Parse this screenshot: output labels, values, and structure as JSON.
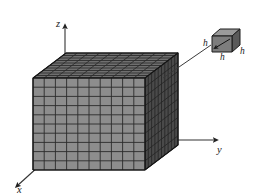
{
  "figure": {
    "title_fragment": "",
    "axes": [
      {
        "name": "z-axis",
        "label": "z",
        "x": 56,
        "y": 25,
        "direction": "up"
      },
      {
        "name": "y-axis",
        "label": "y",
        "x": 221,
        "y": 152,
        "direction": "right"
      },
      {
        "name": "x-axis",
        "label": "x",
        "x": 17,
        "y": 189,
        "direction": "down-left"
      }
    ],
    "big_cube": {
      "name": "subdivided-cube",
      "divisions_front_cols": 10,
      "divisions_front_rows": 10,
      "divisions_depth": 10,
      "front_face_color": "#8d8d8d",
      "top_face_color": "#6f6f6f",
      "right_face_color": "#4a4a4a",
      "grid_line_color": "#2b2b2b"
    },
    "small_cube": {
      "name": "unit-cell-cube",
      "top_face_color": "#9a9a9a",
      "front_face_color": "#7d7d7d",
      "right_face_color": "#5a5a5a",
      "edge_color": "#1d1d1d",
      "labels": [
        {
          "text": "h",
          "x": 207,
          "y": 45,
          "position": "left-edge"
        },
        {
          "text": "h",
          "x": 223,
          "y": 58,
          "position": "bottom-front-edge"
        },
        {
          "text": "h",
          "x": 241,
          "y": 51,
          "position": "right-edge"
        }
      ]
    },
    "callout_line": {
      "name": "callout-leader-line",
      "from_x": 163,
      "from_y": 77,
      "to_x": 212,
      "to_y": 45,
      "color": "#3a3a3a"
    }
  }
}
